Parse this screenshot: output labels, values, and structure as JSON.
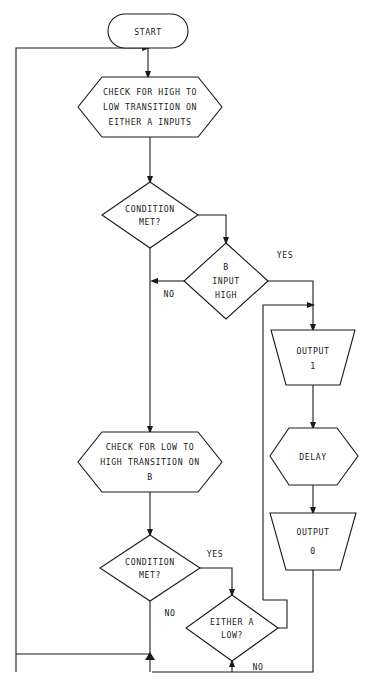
{
  "diagram": {
    "background_color": "#ffffff",
    "line_color": "#1a1a1a",
    "nodes": {
      "start": {
        "shape": "terminator",
        "label": "START"
      },
      "check_high_low": {
        "shape": "hexagon",
        "line1": "CHECK FOR HIGH TO",
        "line2": "LOW TRANSITION ON",
        "line3": "EITHER A INPUTS"
      },
      "condition_met_1": {
        "shape": "diamond",
        "line1": "CONDITION",
        "line2": "MET?"
      },
      "b_input_high": {
        "shape": "diamond",
        "line1": "B",
        "line2": "INPUT",
        "line3": "HIGH"
      },
      "output_1": {
        "shape": "trapezoid",
        "line1": "OUTPUT",
        "line2": "1"
      },
      "delay": {
        "shape": "hexagon",
        "line1": "DELAY"
      },
      "output_0": {
        "shape": "trapezoid",
        "line1": "OUTPUT",
        "line2": "0"
      },
      "check_low_high": {
        "shape": "hexagon",
        "line1": "CHECK FOR LOW TO",
        "line2": "HIGH TRANSITION ON",
        "line3": "B"
      },
      "condition_met_2": {
        "shape": "diamond",
        "line1": "CONDITION",
        "line2": "MET?"
      },
      "either_a_low": {
        "shape": "diamond",
        "line1": "EITHER A",
        "line2": "LOW?"
      }
    },
    "edge_labels": {
      "b_input_high_yes": "YES",
      "b_input_high_no": "NO",
      "condition_met_2_yes": "YES",
      "condition_met_2_no": "NO",
      "either_a_low_no": "NO"
    }
  }
}
